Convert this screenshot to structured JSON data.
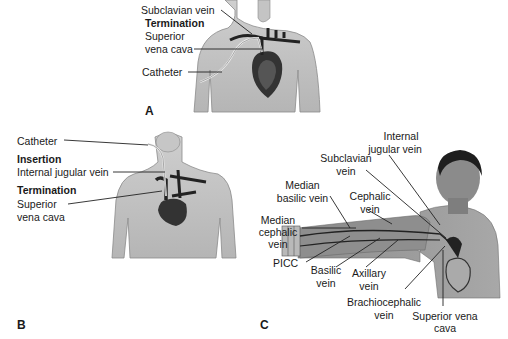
{
  "panels": {
    "A": {
      "letter": "A",
      "labels": {
        "subclavian": "Subclavian vein",
        "termination_heading": "Termination",
        "svc_line1": "Superior",
        "svc_line2": "vena cava",
        "catheter": "Catheter"
      }
    },
    "B": {
      "letter": "B",
      "labels": {
        "catheter": "Catheter",
        "insertion_heading": "Insertion",
        "internal_jugular": "Internal jugular vein",
        "termination_heading": "Termination",
        "svc_line1": "Superior",
        "svc_line2": "vena cava"
      }
    },
    "C": {
      "letter": "C",
      "labels": {
        "internal_jugular_1": "Internal",
        "internal_jugular_2": "jugular vein",
        "subclavian_1": "Subclavian",
        "subclavian_2": "vein",
        "median_basilic_1": "Median",
        "median_basilic_2": "basilic vein",
        "cephalic_1": "Cephalic",
        "cephalic_2": "vein",
        "median_cephalic_1": "Median",
        "median_cephalic_2": "cephalic",
        "median_cephalic_3": "vein",
        "picc": "PICC",
        "basilic_1": "Basilic",
        "basilic_2": "vein",
        "axillary_1": "Axillary",
        "axillary_2": "vein",
        "brachiocephalic_1": "Brachiocephalic",
        "brachiocephalic_2": "vein",
        "svc_1": "Superior vena",
        "svc_2": "cava"
      }
    }
  }
}
